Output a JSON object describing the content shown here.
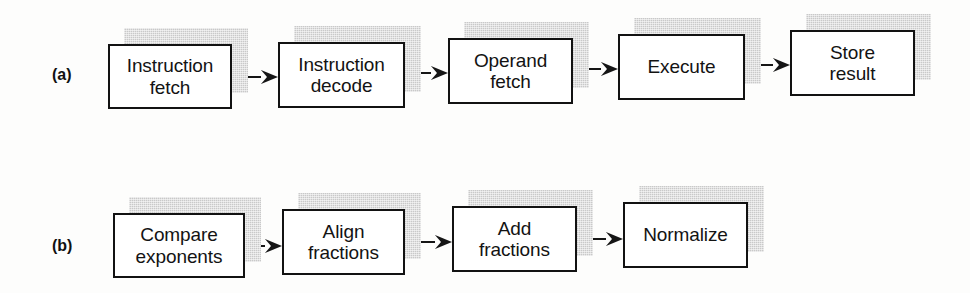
{
  "figure": {
    "type": "pipeline-flow-diagram",
    "background_color": "#fdfdfc",
    "box_border_color": "#121212",
    "box_fill_color": "#ffffff",
    "shadow_color": "#c9c9c9",
    "arrow_color": "#151515"
  },
  "rows": [
    {
      "label": "(a)",
      "label_x": 52,
      "label_y": 67,
      "stages": [
        {
          "text": "Instruction\nfetch",
          "x": 108,
          "y": 44,
          "w": 124,
          "h": 65
        },
        {
          "text": "Instruction\ndecode",
          "x": 278,
          "y": 42,
          "w": 127,
          "h": 66
        },
        {
          "text": "Operand\nfetch",
          "x": 448,
          "y": 38,
          "w": 125,
          "h": 66
        },
        {
          "text": "Execute",
          "x": 618,
          "y": 34,
          "w": 127,
          "h": 66
        },
        {
          "text": "Store\nresult",
          "x": 790,
          "y": 30,
          "w": 125,
          "h": 66
        }
      ],
      "arrows": [
        {
          "x": 233,
          "y": 70,
          "w": 45
        },
        {
          "x": 406,
          "y": 66,
          "w": 42
        },
        {
          "x": 574,
          "y": 62,
          "w": 44
        },
        {
          "x": 746,
          "y": 58,
          "w": 44
        }
      ]
    },
    {
      "label": "(b)",
      "label_x": 52,
      "label_y": 238,
      "stages": [
        {
          "text": "Compare\nexponents",
          "x": 113,
          "y": 213,
          "w": 132,
          "h": 65
        },
        {
          "text": "Align\nfractions",
          "x": 282,
          "y": 209,
          "w": 123,
          "h": 66
        },
        {
          "text": "Add\nfractions",
          "x": 452,
          "y": 206,
          "w": 125,
          "h": 66
        },
        {
          "text": "Normalize",
          "x": 623,
          "y": 202,
          "w": 125,
          "h": 66
        }
      ],
      "arrows": [
        {
          "x": 246,
          "y": 239,
          "w": 36
        },
        {
          "x": 406,
          "y": 235,
          "w": 46
        },
        {
          "x": 578,
          "y": 232,
          "w": 45
        }
      ]
    }
  ]
}
